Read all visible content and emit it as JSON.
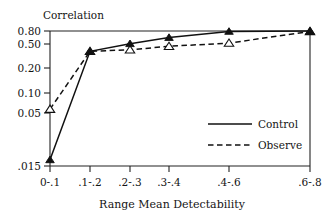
{
  "chart_data": {
    "type": "line",
    "title": "",
    "xlabel": "Range Mean Detectability",
    "ylabel": "Correlation",
    "yscale": "log",
    "ylim": [
      0.015,
      0.8
    ],
    "grid": false,
    "legend_position": "inside-right",
    "categories": [
      "0-.1",
      ".1-.2",
      ".2-.3",
      ".3-.4",
      ".4-.6",
      ".6-.8"
    ],
    "ytick_labels": [
      "0.80",
      "0.50",
      "0.20",
      "0.10",
      "0.05",
      ".015"
    ],
    "ytick_values": [
      0.8,
      0.5,
      0.2,
      0.1,
      0.05,
      0.015
    ],
    "series": [
      {
        "name": "Control",
        "style": "solid",
        "marker": "filled-triangle",
        "values": [
          0.018,
          0.44,
          0.55,
          0.66,
          0.79,
          0.8
        ]
      },
      {
        "name": "Observe",
        "style": "dashed",
        "marker": "open-triangle",
        "values": [
          0.08,
          0.44,
          0.46,
          0.51,
          0.56,
          0.79
        ]
      }
    ]
  },
  "axes": {
    "y_axis_title": "Correlation",
    "x_axis_title": "Range Mean Detectability"
  },
  "legend": {
    "entries": [
      {
        "label": "Control",
        "style": "solid"
      },
      {
        "label": "Observe",
        "style": "dashed"
      }
    ]
  }
}
